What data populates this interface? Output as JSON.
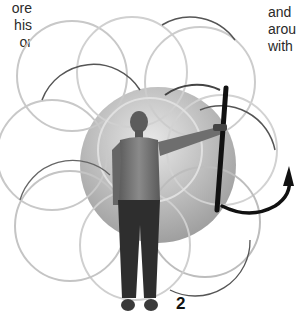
{
  "figure": {
    "number": "2",
    "left_text_lines": [
      "ore",
      "his",
      "or"
    ],
    "right_text_lines": [
      "and",
      "arou",
      "with"
    ]
  },
  "illustration": {
    "sphere": {
      "cx": 158,
      "cy": 165,
      "r": 78,
      "color": "#b0b0b0"
    },
    "rings": [
      {
        "cx": 72,
        "cy": 76,
        "r": 55
      },
      {
        "cx": 132,
        "cy": 72,
        "r": 55
      },
      {
        "cx": 200,
        "cy": 82,
        "r": 55
      },
      {
        "cx": 215,
        "cy": 150,
        "r": 55
      },
      {
        "cx": 200,
        "cy": 218,
        "r": 55
      },
      {
        "cx": 135,
        "cy": 240,
        "r": 55
      },
      {
        "cx": 72,
        "cy": 224,
        "r": 55
      },
      {
        "cx": 55,
        "cy": 155,
        "r": 55
      },
      {
        "cx": 140,
        "cy": 155,
        "r": 55
      }
    ],
    "staff_color": "#111111",
    "arrow": "curved-arrow-up"
  }
}
